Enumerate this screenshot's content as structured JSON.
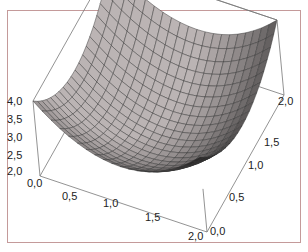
{
  "chart_data": {
    "type": "surface3d",
    "title": "",
    "function_description": "bowl-shaped surface, minimum at center (1,1), z=4.0 at corners",
    "x_axis": {
      "label": "",
      "ticks": [
        "0,0",
        "0,5",
        "1,0",
        "1,5",
        "2,0"
      ],
      "range": [
        0,
        2
      ]
    },
    "y_axis": {
      "label": "",
      "ticks": [
        "0,0",
        "0,5",
        "1,0",
        "1,5",
        "2,0"
      ],
      "range": [
        0,
        2
      ]
    },
    "z_axis": {
      "label": "",
      "ticks": [
        "2,0",
        "2,5",
        "3,0",
        "3,5",
        "4,0"
      ],
      "range": [
        2,
        4
      ]
    },
    "grid_resolution": 20,
    "surface_color_light": "#c8c8c8",
    "surface_color_dark": "#2a2020",
    "mesh_line_color": "#333333",
    "frame_color": "#c49a9a",
    "box_line_color": "#777777"
  },
  "labels": {
    "z": [
      "4,0",
      "3,5",
      "3,0",
      "2,5",
      "2,0"
    ],
    "x": [
      "0,0",
      "0,5",
      "1,0",
      "1,5",
      "2,0"
    ],
    "y": [
      "0,0",
      "0,5",
      "1,0",
      "1,5",
      "2,0"
    ]
  }
}
